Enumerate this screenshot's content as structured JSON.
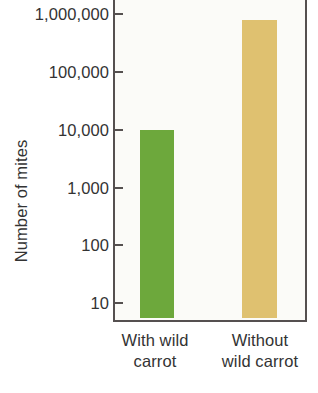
{
  "chart_data": {
    "type": "bar",
    "title": "",
    "subtitle": "",
    "xlabel": "",
    "ylabel": "Number of mites",
    "yscale": "log",
    "ylim": [
      3,
      1600000
    ],
    "grid": false,
    "legend": false,
    "categories": [
      "With wild carrot",
      "Without wild carrot"
    ],
    "category_lines": [
      [
        "With wild",
        "carrot"
      ],
      [
        "Without",
        "wild carrot"
      ]
    ],
    "values": [
      10000,
      800000
    ],
    "ytick_labels": [
      "1,000,000",
      "100,000",
      "10,000",
      "1,000",
      "100",
      "10"
    ],
    "ytick_values": [
      1000000,
      100000,
      10000,
      1000,
      100,
      10
    ],
    "bar_colors": [
      "#6da83c",
      "#dfc170"
    ],
    "series": [
      {
        "name": "Number of mites",
        "values": [
          10000,
          800000
        ]
      }
    ]
  },
  "figure": {
    "background_color": "#ffffff",
    "plot_background_color": "#fbfbf8",
    "axis_color": "#555050",
    "text_color": "#333333"
  }
}
